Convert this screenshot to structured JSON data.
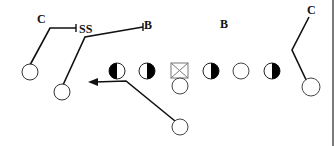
{
  "diagram": {
    "type": "football-play",
    "labels": {
      "corner_left": "C",
      "strong_safety": "SS",
      "backer_left": "B",
      "backer_right": "B",
      "corner_right": "C"
    },
    "offense_players": [
      {
        "id": "lt",
        "shape": "circle",
        "fill": "left-half-black"
      },
      {
        "id": "lg",
        "shape": "circle",
        "fill": "right-half-black"
      },
      {
        "id": "center",
        "shape": "square-x"
      },
      {
        "id": "rg",
        "shape": "circle",
        "fill": "right-half-black"
      },
      {
        "id": "rt",
        "shape": "circle",
        "fill": "none"
      },
      {
        "id": "te",
        "shape": "circle",
        "fill": "right-half-black"
      },
      {
        "id": "qb",
        "shape": "circle",
        "fill": "none"
      },
      {
        "id": "wr-left",
        "shape": "circle",
        "fill": "none"
      },
      {
        "id": "slot-left",
        "shape": "circle",
        "fill": "none"
      },
      {
        "id": "rb",
        "shape": "circle",
        "fill": "none"
      },
      {
        "id": "wr-right",
        "shape": "circle",
        "fill": "none"
      }
    ],
    "colors": {
      "line": "#111111",
      "fill": "#000000",
      "background": "#ffffff"
    }
  }
}
